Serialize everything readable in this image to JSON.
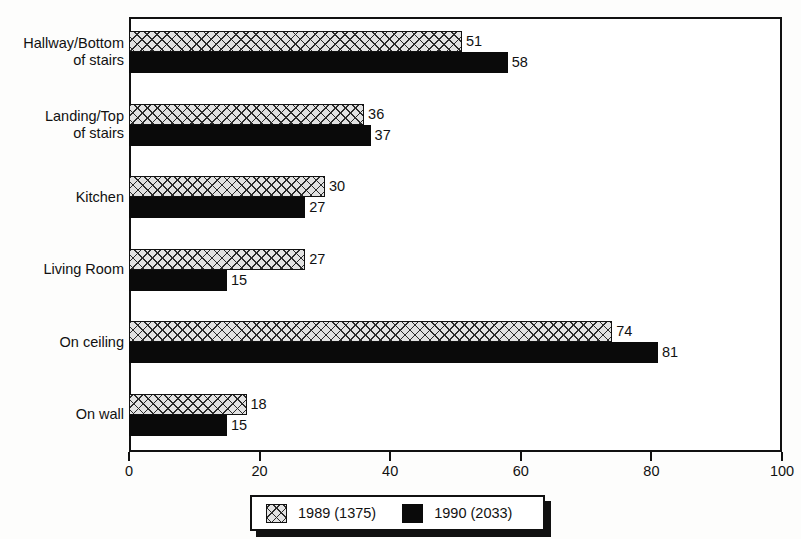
{
  "chart_data": {
    "type": "bar",
    "orientation": "horizontal",
    "title": "",
    "xlabel": "",
    "ylabel": "",
    "xlim": [
      0,
      100
    ],
    "xticks": [
      "0",
      "20",
      "40",
      "60",
      "80",
      "100"
    ],
    "grid": false,
    "legend_position": "bottom",
    "categories": [
      "Hallway/Bottom\nof stairs",
      "Landing/Top\nof stairs",
      "Kitchen",
      "Living Room",
      "On ceiling",
      "On wall"
    ],
    "series": [
      {
        "name": "1989 (1375)",
        "fill": "cross-hatch",
        "color": "#e2e2e2",
        "values": [
          51,
          36,
          30,
          27,
          74,
          18
        ]
      },
      {
        "name": "1990 (2033)",
        "fill": "solid",
        "color": "#0a0a0a",
        "values": [
          58,
          37,
          27,
          15,
          81,
          15
        ]
      }
    ],
    "data_labels": [
      {
        "category": "Hallway/Bottom of stairs",
        "1989": "51",
        "1990": "58"
      },
      {
        "category": "Landing/Top of stairs",
        "1989": "36",
        "1990": "37"
      },
      {
        "category": "Kitchen",
        "1989": "30",
        "1990": "27"
      },
      {
        "category": "Living Room",
        "1989": "27",
        "1990": "15"
      },
      {
        "category": "On ceiling",
        "1989": "74",
        "1990": "81"
      },
      {
        "category": "On wall",
        "1989": "18",
        "1990": "15"
      }
    ]
  },
  "legend": {
    "entries": [
      {
        "label": "1989 (1375)",
        "swatch": "cross-hatch-swatch"
      },
      {
        "label": "1990 (2033)",
        "swatch": "solid-black-swatch"
      }
    ]
  }
}
